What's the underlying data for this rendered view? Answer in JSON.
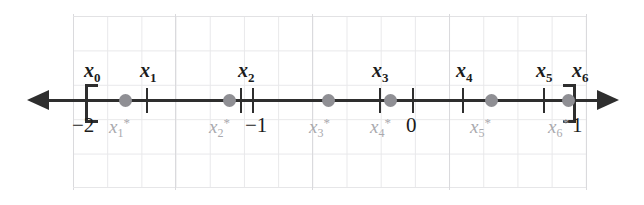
{
  "figure": {
    "axis": {
      "type": "number-line",
      "domain_min": -2,
      "domain_max": 1,
      "arrow_left": true,
      "arrow_right": true,
      "line_color": "#2e2e2e"
    },
    "grid": {
      "visible": true,
      "color": "#e8e8ea",
      "cell_px": 34
    },
    "colors": {
      "partition": "#1c1c1c",
      "sample": "#a9a9ae",
      "dot": "#8f8f94",
      "axis": "#2e2e2e",
      "grid": "#e8e8ea"
    },
    "partition_points": [
      {
        "id": "x0",
        "label": "x",
        "sub": "0",
        "value": -2,
        "marker": "bracket-left",
        "x_px": 85,
        "label_x_px": 84,
        "label_y_px": 60
      },
      {
        "id": "x1",
        "label": "x",
        "sub": "1",
        "value": -1.52,
        "marker": "tick",
        "x_px": 146,
        "label_x_px": 140,
        "label_y_px": 60
      },
      {
        "id": "x2",
        "label": "x",
        "sub": "2",
        "value": -1.06,
        "marker": "tick",
        "x_px": 240,
        "label_x_px": 238,
        "label_y_px": 60
      },
      {
        "id": "x3",
        "label": "x",
        "sub": "3",
        "value": -0.35,
        "marker": "tick",
        "x_px": 379,
        "label_x_px": 372,
        "label_y_px": 60
      },
      {
        "id": "x4",
        "label": "x",
        "sub": "4",
        "value": 0.27,
        "marker": "tick",
        "x_px": 462,
        "label_x_px": 456,
        "label_y_px": 60
      },
      {
        "id": "x5",
        "label": "x",
        "sub": "5",
        "value": 0.74,
        "marker": "tick",
        "x_px": 543,
        "label_x_px": 536,
        "label_y_px": 60
      },
      {
        "id": "x6",
        "label": "x",
        "sub": "6",
        "value": 1,
        "marker": "bracket-right",
        "x_px": 567,
        "label_x_px": 572,
        "label_y_px": 60
      }
    ],
    "sample_points": [
      {
        "id": "x1s",
        "label": "x",
        "sub": "1",
        "sup": "*",
        "x_px": 119,
        "label_x_px": 109,
        "label_y_px": 116
      },
      {
        "id": "x2s",
        "label": "x",
        "sub": "2",
        "sup": "*",
        "x_px": 223,
        "label_x_px": 209,
        "label_y_px": 116
      },
      {
        "id": "x3s",
        "label": "x",
        "sub": "3",
        "sup": "*",
        "x_px": 322,
        "label_x_px": 309,
        "label_y_px": 116
      },
      {
        "id": "x4s",
        "label": "x",
        "sub": "4",
        "sup": "*",
        "x_px": 384,
        "label_x_px": 370,
        "label_y_px": 116
      },
      {
        "id": "x5s",
        "label": "x",
        "sub": "5",
        "sup": "*",
        "x_px": 485,
        "label_x_px": 470,
        "label_y_px": 116
      },
      {
        "id": "x6s",
        "label": "x",
        "sub": "6",
        "sup": "*",
        "x_px": 562,
        "label_x_px": 548,
        "label_y_px": 116
      }
    ],
    "axis_numbers": [
      {
        "id": "neg2",
        "text": "−2",
        "value": -2,
        "tick": false,
        "x_px": 72,
        "label_y_px": 115
      },
      {
        "id": "neg1",
        "text": "−1",
        "value": -1,
        "tick": true,
        "tick_x_px": 252,
        "x_px": 245,
        "label_y_px": 115
      },
      {
        "id": "zero",
        "text": "0",
        "value": 0,
        "tick": true,
        "tick_x_px": 412,
        "x_px": 406,
        "label_y_px": 115
      },
      {
        "id": "one",
        "text": "1",
        "value": 1,
        "tick": false,
        "x_px": 572,
        "label_y_px": 115
      }
    ]
  }
}
